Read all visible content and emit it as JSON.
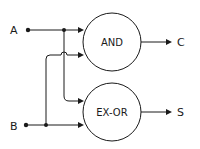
{
  "diagram": {
    "inputs": [
      {
        "id": "A",
        "label": "A"
      },
      {
        "id": "B",
        "label": "B"
      }
    ],
    "gates": [
      {
        "id": "and",
        "label": "AND"
      },
      {
        "id": "xor",
        "label": "EX-OR"
      }
    ],
    "outputs": [
      {
        "id": "C",
        "label": "C"
      },
      {
        "id": "S",
        "label": "S"
      }
    ],
    "connections": [
      {
        "from": "A",
        "to": "and"
      },
      {
        "from": "A",
        "to": "xor"
      },
      {
        "from": "B",
        "to": "and"
      },
      {
        "from": "B",
        "to": "xor"
      },
      {
        "from": "and",
        "to": "C"
      },
      {
        "from": "xor",
        "to": "S"
      }
    ],
    "colors": {
      "line": "#1a1a1a",
      "background": "#ffffff"
    }
  }
}
